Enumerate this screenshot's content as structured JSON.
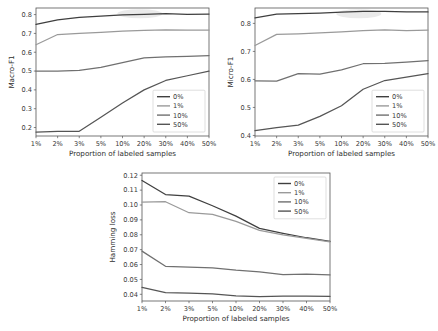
{
  "figure": {
    "background": "#ffffff",
    "xlabel": "Proportion of labeled samples",
    "categories": [
      "1%",
      "2%",
      "3%",
      "5%",
      "10%",
      "20%",
      "30%",
      "40%",
      "50%"
    ],
    "legend_entries": [
      "0%",
      "1%",
      "10%",
      "50%"
    ],
    "series_colors": [
      "#3f3f3f",
      "#9a9a9a",
      "#707070",
      "#555555"
    ]
  },
  "chart_data": [
    {
      "id": "macro-f1",
      "type": "line",
      "title": "",
      "xlabel": "Proportion of labeled samples",
      "ylabel": "Macro-F1",
      "categories": [
        "1%",
        "2%",
        "3%",
        "5%",
        "10%",
        "20%",
        "30%",
        "40%",
        "50%"
      ],
      "yticks": [
        0.2,
        0.3,
        0.4,
        0.5,
        0.6,
        0.7,
        0.8
      ],
      "ytick_labels": [
        "0.2",
        "0.3",
        "0.4",
        "0.5",
        "0.6",
        "0.7",
        "0.8"
      ],
      "ylim": [
        0.155,
        0.835
      ],
      "grid": false,
      "legend_position": "lower-right",
      "series": [
        {
          "name": "0%",
          "color": "#3f3f3f",
          "values": [
            0.748,
            0.772,
            0.785,
            0.792,
            0.799,
            0.801,
            0.805,
            0.801,
            0.803
          ]
        },
        {
          "name": "1%",
          "color": "#9a9a9a",
          "values": [
            0.64,
            0.694,
            0.7,
            0.706,
            0.712,
            0.716,
            0.719,
            0.718,
            0.718
          ]
        },
        {
          "name": "10%",
          "color": "#707070",
          "values": [
            0.5,
            0.5,
            0.503,
            0.52,
            0.545,
            0.57,
            0.575,
            0.578,
            0.582
          ]
        },
        {
          "name": "50%",
          "color": "#555555",
          "values": [
            0.176,
            0.18,
            0.18,
            0.255,
            0.33,
            0.4,
            0.45,
            0.475,
            0.5
          ]
        }
      ]
    },
    {
      "id": "micro-f1",
      "type": "line",
      "title": "",
      "xlabel": "Proportion of labeled samples",
      "ylabel": "Micro-F1",
      "categories": [
        "1%",
        "2%",
        "3%",
        "5%",
        "10%",
        "20%",
        "30%",
        "40%",
        "50%"
      ],
      "yticks": [
        0.4,
        0.5,
        0.6,
        0.7,
        0.8
      ],
      "ytick_labels": [
        "0.4",
        "0.5",
        "0.6",
        "0.7",
        "0.8"
      ],
      "ylim": [
        0.398,
        0.855
      ],
      "grid": false,
      "legend_position": "lower-right",
      "series": [
        {
          "name": "0%",
          "color": "#3f3f3f",
          "values": [
            0.82,
            0.833,
            0.835,
            0.837,
            0.84,
            0.843,
            0.843,
            0.841,
            0.841
          ]
        },
        {
          "name": "1%",
          "color": "#9a9a9a",
          "values": [
            0.721,
            0.761,
            0.763,
            0.766,
            0.77,
            0.774,
            0.777,
            0.774,
            0.776
          ]
        },
        {
          "name": "10%",
          "color": "#707070",
          "values": [
            0.595,
            0.594,
            0.621,
            0.619,
            0.634,
            0.656,
            0.657,
            0.662,
            0.667
          ]
        },
        {
          "name": "50%",
          "color": "#555555",
          "values": [
            0.417,
            0.428,
            0.437,
            0.468,
            0.506,
            0.565,
            0.596,
            0.608,
            0.621
          ]
        }
      ]
    },
    {
      "id": "hamming-loss",
      "type": "line",
      "title": "",
      "xlabel": "Proportion of labeled samples",
      "ylabel": "Hamming loss",
      "categories": [
        "1%",
        "2%",
        "3%",
        "5%",
        "10%",
        "20%",
        "30%",
        "40%",
        "50%"
      ],
      "yticks": [
        0.04,
        0.05,
        0.06,
        0.07,
        0.08,
        0.09,
        0.1,
        0.11,
        0.12
      ],
      "ytick_labels": [
        "0.04",
        "0.05",
        "0.06",
        "0.07",
        "0.08",
        "0.09",
        "0.10",
        "0.11",
        "0.12"
      ],
      "ylim": [
        0.0355,
        0.1215
      ],
      "grid": false,
      "legend_position": "upper-right",
      "series": [
        {
          "name": "0%",
          "color": "#3f3f3f",
          "values": [
            0.1165,
            0.107,
            0.106,
            0.0995,
            0.0925,
            0.0843,
            0.081,
            0.078,
            0.0755
          ]
        },
        {
          "name": "1%",
          "color": "#9a9a9a",
          "values": [
            0.102,
            0.1022,
            0.0948,
            0.0937,
            0.089,
            0.083,
            0.08,
            0.0775,
            0.0752
          ]
        },
        {
          "name": "10%",
          "color": "#707070",
          "values": [
            0.069,
            0.0588,
            0.0583,
            0.0578,
            0.0562,
            0.055,
            0.0533,
            0.0536,
            0.053
          ]
        },
        {
          "name": "50%",
          "color": "#555555",
          "values": [
            0.0447,
            0.0412,
            0.0408,
            0.0403,
            0.039,
            0.0384,
            0.0387,
            0.0387,
            0.0386
          ]
        }
      ]
    }
  ]
}
